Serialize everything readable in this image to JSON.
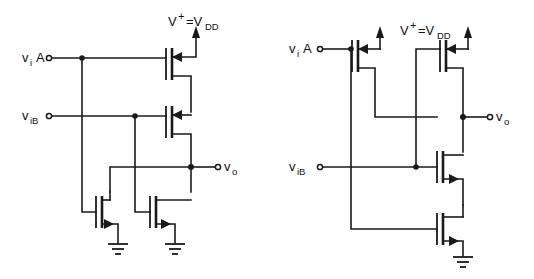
{
  "figure": {
    "title": "",
    "background_color": "#ffffff",
    "line_color": "#1a1a1a",
    "width": 534,
    "height": 279
  },
  "circuits": [
    {
      "id": "left",
      "name": "cmos-nand-gate",
      "supply_label": {
        "v": "V",
        "plus": "+",
        "equals": "=V",
        "sub": "DD"
      },
      "inputs": [
        {
          "v": "v",
          "sub": "i",
          "suffix": "A"
        },
        {
          "v": "v",
          "sub": "iB",
          "suffix": ""
        }
      ],
      "output": {
        "v": "v",
        "sub": "o"
      },
      "pmos_count": 2,
      "nmos_count": 2,
      "topology": "series-pmos / parallel-nmos",
      "ground_count": 2
    },
    {
      "id": "right",
      "name": "cmos-nor-gate",
      "supply_label": {
        "v": "V",
        "plus": "+",
        "equals": "=V",
        "sub": "DD"
      },
      "inputs": [
        {
          "v": "v",
          "sub": "i",
          "suffix": "A"
        },
        {
          "v": "v",
          "sub": "iB",
          "suffix": ""
        }
      ],
      "output": {
        "v": "v",
        "sub": "o"
      },
      "pmos_count": 2,
      "nmos_count": 2,
      "topology": "parallel-pmos / series-nmos",
      "ground_count": 1
    }
  ]
}
